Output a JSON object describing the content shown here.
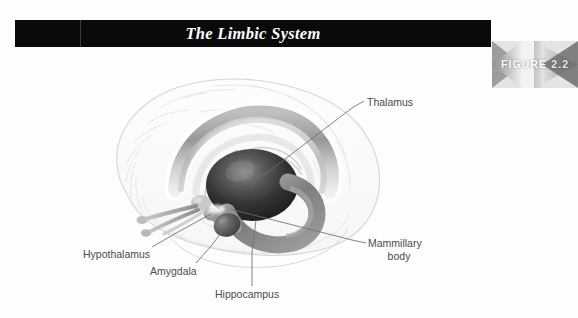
{
  "figure": {
    "title": "The Limbic System",
    "badge_word": "FIGURE",
    "badge_number": "2.2"
  },
  "labels": {
    "thalamus": "Thalamus",
    "mammillary_line1": "Mammillary",
    "mammillary_line2": "body",
    "hypothalamus": "Hypothalamus",
    "amygdala": "Amygdala",
    "hippocampus": "Hippocampus"
  },
  "colors": {
    "title_bar_bg": "#0a0a0a",
    "title_text": "#ffffff",
    "page_bg": "#fdfdfd",
    "label_text": "#4c4c4c",
    "leader_line": "#6e6e6e",
    "brain_outline": "#d8d8d8",
    "brain_fill": "#fbfbfb",
    "cingulate_gray": "#9b9b9b",
    "thalamus_dark": "#2b2b2b",
    "hippocampus_gray": "#8d8d8d",
    "badge_light": "#f0f0f0",
    "badge_dark": "#6b6b6b"
  },
  "illustration": {
    "subject": "mid-sagittal brain with limbic system structures",
    "structures": [
      "cerebral cortex outline",
      "cingulate gyrus",
      "thalamus",
      "hypothalamus",
      "amygdala",
      "hippocampus",
      "mammillary body",
      "fornix",
      "olfactory tract"
    ]
  }
}
